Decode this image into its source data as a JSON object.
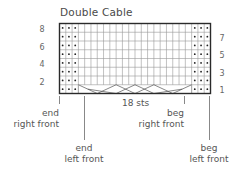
{
  "title": "Double Cable",
  "chart": {
    "columns": 24,
    "rows": 8,
    "purl_columns_left": 3,
    "purl_columns_right": 3,
    "cable_stitches": 18,
    "stitch_count_label": "18 sts",
    "rows_left_labels": [
      "8",
      "6",
      "4",
      "2"
    ],
    "rows_right_labels": [
      "7",
      "5",
      "3",
      "1"
    ],
    "purl_symbol": "dot",
    "cable_row": 1,
    "colors": {
      "grid": "#999999",
      "border": "#2a2a2a",
      "text": "#555555"
    }
  },
  "markers": {
    "end_right_front": {
      "line1": "end",
      "line2": "right front"
    },
    "end_left_front": {
      "line1": "end",
      "line2": "left front"
    },
    "beg_right_front": {
      "line1": "beg",
      "line2": "right front"
    },
    "beg_left_front": {
      "line1": "beg",
      "line2": "left front"
    }
  }
}
